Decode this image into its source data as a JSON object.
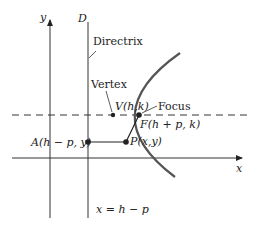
{
  "diagram": {
    "colors": {
      "ink": "#222222",
      "curve": "#555555",
      "background": "#ffffff"
    },
    "axes": {
      "x_label": "x",
      "y_label": "y"
    },
    "directrix": {
      "letter": "D",
      "name": "Directrix",
      "equation": "x = h − p"
    },
    "points": {
      "vertex": {
        "name": "Vertex",
        "label": "V(h,k)"
      },
      "focus": {
        "name": "Focus",
        "label": "F(h + p, k)"
      },
      "point": {
        "label": "P(x,y)"
      },
      "directrix_point": {
        "label": "A(h − p, y)"
      }
    }
  }
}
